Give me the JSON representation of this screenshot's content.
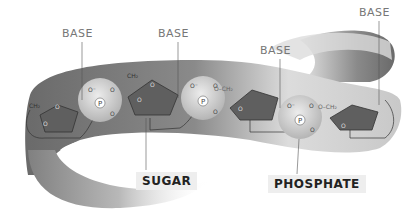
{
  "diagram": {
    "labels": {
      "base": [
        "BASE",
        "BASE",
        "BASE",
        "BASE"
      ],
      "sugar": "SUGAR",
      "phosphate": "PHOSPHATE"
    },
    "atoms": {
      "phosphorus": "P",
      "oxygen": "O",
      "oxygen_minus": "O⁻",
      "methylene": "CH₂",
      "o_ch2": "O–CH₂"
    },
    "colors": {
      "ribbon_dark": "#6e6e6e",
      "ribbon_light": "#d6d6d6",
      "sugar_fill": "#5f5f5f",
      "phosphate_fill": "#c8c8c8",
      "label_text": "#777777",
      "callout_bg": "#eeeeee"
    }
  }
}
